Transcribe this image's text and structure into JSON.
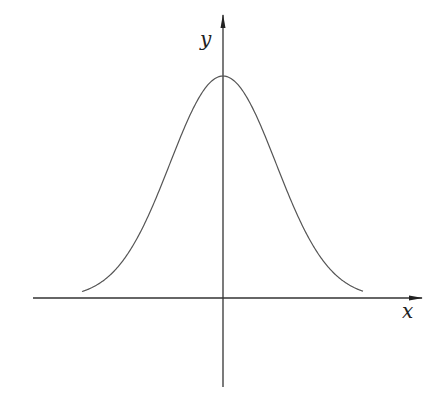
{
  "diagram": {
    "type": "gaussian-bell-curve",
    "axes": {
      "x": {
        "label": "x",
        "from": [
          33,
          298
        ],
        "to": [
          422,
          298
        ]
      },
      "y": {
        "label": "y",
        "from": [
          223,
          387
        ],
        "to": [
          223,
          15
        ]
      }
    },
    "curve": {
      "center_x": 223,
      "baseline_y": 298,
      "peak_y": 76,
      "sigma_px": 53,
      "x_start": 82,
      "x_end": 363
    },
    "colors": {
      "axis": "#333333",
      "curve": "#555555",
      "label": "#222222",
      "background": "#ffffff"
    }
  }
}
